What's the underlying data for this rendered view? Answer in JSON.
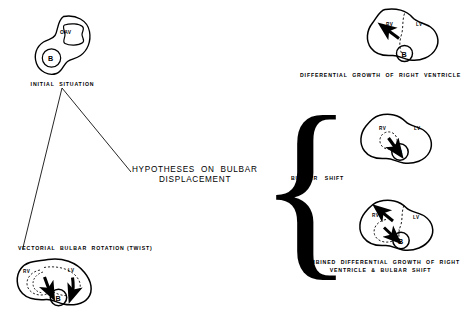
{
  "figure": {
    "title": "Hypotheses on Bulbar Displacement",
    "width": 471,
    "height": 327,
    "ink_color": "#000000",
    "background_color": "#ffffff"
  },
  "center": {
    "main_label_line1": "HYPOTHESES  ON  BULBAR",
    "main_label_line2": "DISPLACEMENT",
    "brace_glyph": "{",
    "brace_label": "BULBAR   SHIFT"
  },
  "panels": {
    "initial": {
      "caption": "INITIAL  SITUATION",
      "labels": {
        "bulb": "B",
        "outflow": "OAV"
      }
    },
    "twist": {
      "caption": "VECTORIAL  BULBAR  ROTATION (TWIST)",
      "labels": {
        "right_ventricle": "RV",
        "left_ventricle": "LV",
        "bulb": "B"
      }
    },
    "differential_growth": {
      "caption": "DIFFERENTIAL  GROWTH  OF  RIGHT  VENTRICLE",
      "labels": {
        "right_ventricle": "RV",
        "left_ventricle": "LV",
        "bulb": "B"
      }
    },
    "bulbar_shift": {
      "caption": "",
      "labels": {
        "right_ventricle": "RV",
        "left_ventricle": "LV",
        "bulb": "B"
      }
    },
    "combined": {
      "caption_line1": "COMBINED  DIFFERENTIAL  GROWTH  OF  RIGHT",
      "caption_line2": "VENTRICLE  &  BULBAR  SHIFT",
      "labels": {
        "right_ventricle": "RV",
        "left_ventricle": "LV",
        "bulb": "B"
      }
    }
  }
}
